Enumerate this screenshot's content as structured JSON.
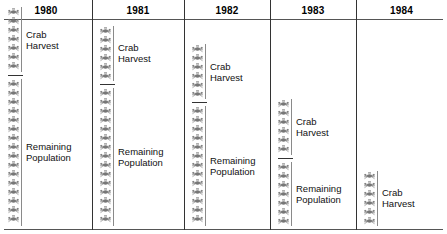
{
  "figure": {
    "type": "pictogram-table",
    "icon_name": "crab-icon",
    "icon_label": "crab",
    "line_color": "#555555",
    "bracket_color": "#8a8a8a",
    "icon_color": "#777777"
  },
  "header": {
    "years": [
      "1980",
      "1981",
      "1982",
      "1983",
      "1984"
    ]
  },
  "labels": {
    "crab_harvest": "Crab\nHarvest",
    "remaining_population": "Remaining\nPopulation"
  },
  "chart_data": {
    "type": "bar",
    "title": "",
    "subtitle": "",
    "xlabel": "",
    "ylabel": "",
    "grid": false,
    "legend_position": "inline-labels",
    "unit": "crab icons",
    "categories": [
      "1980",
      "1981",
      "1982",
      "1983",
      "1984"
    ],
    "series": [
      {
        "name": "Crab Harvest",
        "values": [
          7,
          6,
          6,
          6,
          6
        ]
      },
      {
        "name": "Remaining Population",
        "values": [
          16,
          15,
          13,
          7,
          0
        ]
      }
    ],
    "annotations": [
      "Each icon represents a fixed number of crabs",
      "Stacks are anchored to the bottom of each column",
      "Harvest group sits above remaining population group, divided by a short rule"
    ]
  },
  "columns": [
    {
      "year": "1980",
      "groups": [
        {
          "name": "crab-harvest",
          "label_key": "crab_harvest",
          "count": 7
        },
        {
          "name": "remaining-population",
          "label_key": "remaining_population",
          "count": 16
        }
      ]
    },
    {
      "year": "1981",
      "groups": [
        {
          "name": "crab-harvest",
          "label_key": "crab_harvest",
          "count": 6
        },
        {
          "name": "remaining-population",
          "label_key": "remaining_population",
          "count": 15
        }
      ]
    },
    {
      "year": "1982",
      "groups": [
        {
          "name": "crab-harvest",
          "label_key": "crab_harvest",
          "count": 6
        },
        {
          "name": "remaining-population",
          "label_key": "remaining_population",
          "count": 13
        }
      ]
    },
    {
      "year": "1983",
      "groups": [
        {
          "name": "crab-harvest",
          "label_key": "crab_harvest",
          "count": 6
        },
        {
          "name": "remaining-population",
          "label_key": "remaining_population",
          "count": 7
        }
      ]
    },
    {
      "year": "1984",
      "groups": [
        {
          "name": "crab-harvest",
          "label_key": "crab_harvest",
          "count": 6
        }
      ]
    }
  ],
  "layout": {
    "column_edges": [
      0,
      92,
      184,
      270,
      356,
      447
    ],
    "icon_height": 9.2,
    "body_bottom": 206
  }
}
